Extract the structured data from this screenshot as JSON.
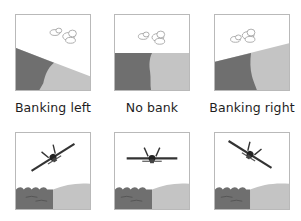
{
  "labels": {
    "left": "Banking left",
    "center": "No bank",
    "right": "Banking right"
  },
  "colors": {
    "sky": "#ffffff",
    "dark_ground": "#6f6f6f",
    "light_ground": "#c4c4c4",
    "frame_border": "#b9b9b9",
    "label_text": "#1e1e1e"
  },
  "panels": {
    "top": [
      {
        "id": "horizon-left",
        "bank": "left",
        "content": "tilted horizon, clouds"
      },
      {
        "id": "horizon-center",
        "bank": "none",
        "content": "level horizon, clouds"
      },
      {
        "id": "horizon-right",
        "bank": "right",
        "content": "tilted horizon, clouds"
      }
    ],
    "bottom": [
      {
        "id": "aircraft-left",
        "bank": "left",
        "content": "aircraft front view rolled left over water and land"
      },
      {
        "id": "aircraft-center",
        "bank": "none",
        "content": "aircraft front view level over water and land"
      },
      {
        "id": "aircraft-right",
        "bank": "right",
        "content": "aircraft front view rolled right over water and land"
      }
    ]
  }
}
